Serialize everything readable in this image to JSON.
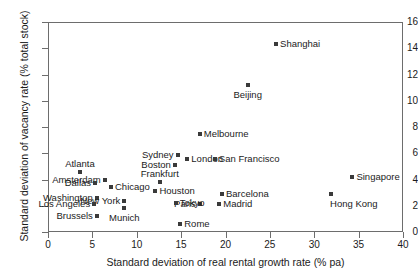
{
  "chart_data": {
    "type": "scatter",
    "title": "",
    "xlabel": "Standard deviation of real rental growth rate (% pa)",
    "ylabel": "Standard deviation of vacancy rate (% total stock)",
    "xlim": [
      0,
      40
    ],
    "ylim": [
      0,
      16
    ],
    "xticks": [
      "0",
      "5",
      "10",
      "15",
      "20",
      "25",
      "30",
      "35",
      "40"
    ],
    "yticks": [
      "0",
      "2",
      "4",
      "6",
      "8",
      "10",
      "12",
      "14",
      "16"
    ],
    "grid": false,
    "legend": "none",
    "marker_color": "#3a3a3a",
    "points": [
      {
        "label": "Shanghai",
        "x": 25.7,
        "y": 14.3,
        "pos": "right"
      },
      {
        "label": "Beijing",
        "x": 22.5,
        "y": 11.2,
        "pos": "below"
      },
      {
        "label": "Melbourne",
        "x": 17.1,
        "y": 7.5,
        "pos": "right"
      },
      {
        "label": "Sydney",
        "x": 14.6,
        "y": 5.9,
        "pos": "left"
      },
      {
        "label": "London",
        "x": 15.7,
        "y": 5.6,
        "pos": "right"
      },
      {
        "label": "San Francisco",
        "x": 18.8,
        "y": 5.6,
        "pos": "right"
      },
      {
        "label": "Boston",
        "x": 14.3,
        "y": 5.1,
        "pos": "left"
      },
      {
        "label": "Atlanta",
        "x": 3.6,
        "y": 4.6,
        "pos": "above"
      },
      {
        "label": "Amsterdam",
        "x": 6.4,
        "y": 4.0,
        "pos": "left"
      },
      {
        "label": "Frankfurt",
        "x": 12.6,
        "y": 3.8,
        "pos": "above"
      },
      {
        "label": "Dallas",
        "x": 5.3,
        "y": 3.7,
        "pos": "left"
      },
      {
        "label": "Chicago",
        "x": 7.1,
        "y": 3.4,
        "pos": "right"
      },
      {
        "label": "Houston",
        "x": 12.1,
        "y": 3.1,
        "pos": "right"
      },
      {
        "label": "Barcelona",
        "x": 19.6,
        "y": 2.9,
        "pos": "right"
      },
      {
        "label": "Washington",
        "x": 5.5,
        "y": 2.6,
        "pos": "left"
      },
      {
        "label": "Paris",
        "x": 17.1,
        "y": 2.1,
        "pos": "left"
      },
      {
        "label": "Madrid",
        "x": 19.3,
        "y": 2.1,
        "pos": "right"
      },
      {
        "label": "New York",
        "x": 8.6,
        "y": 2.4,
        "pos": "left"
      },
      {
        "label": "Tokyo",
        "x": 14.4,
        "y": 2.2,
        "pos": "right"
      },
      {
        "label": "Los Angeles",
        "x": 5.2,
        "y": 2.1,
        "pos": "left"
      },
      {
        "label": "Munich",
        "x": 8.6,
        "y": 1.8,
        "pos": "below"
      },
      {
        "label": "Brussels",
        "x": 5.5,
        "y": 1.2,
        "pos": "left"
      },
      {
        "label": "Rome",
        "x": 14.9,
        "y": 0.6,
        "pos": "right"
      },
      {
        "label": "Singapore",
        "x": 34.3,
        "y": 4.2,
        "pos": "right"
      },
      {
        "label": "Hong Kong",
        "x": 31.9,
        "y": 2.9,
        "pos": "below-right"
      }
    ]
  }
}
